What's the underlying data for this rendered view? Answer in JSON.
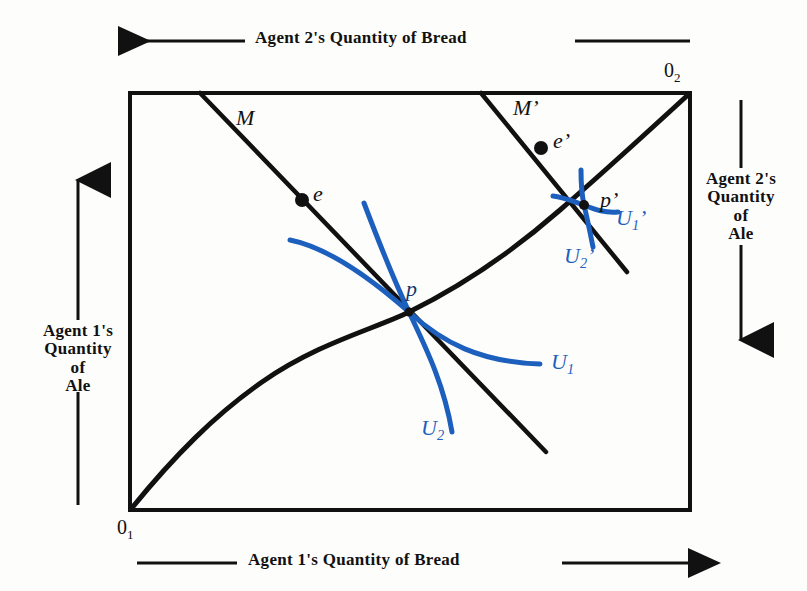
{
  "figure": {
    "type": "edgeworth-box",
    "title_top": "Agent 2's Quantity of Bread",
    "title_bottom": "Agent 1's Quantity of Bread",
    "title_left_lines": [
      "Agent 1's",
      "Quantity",
      "of",
      "Ale"
    ],
    "title_right_lines": [
      "Agent 2's",
      "Quantity",
      "of",
      "Ale"
    ],
    "origin_1": "0",
    "origin_1_sub": "1",
    "origin_2": "0",
    "origin_2_sub": "2",
    "colors": {
      "indifference_blue": "#1d5fbd",
      "line_black": "#111111",
      "background": "#fdfdfb"
    },
    "labels": {
      "budget_line_1": "M",
      "budget_line_2": "M’",
      "endowment_1": "e",
      "endowment_2": "e’",
      "equilibrium_1": "p",
      "equilibrium_2": "p’",
      "indiff_u1": "U",
      "indiff_u1_sub": "1",
      "indiff_u2": "U",
      "indiff_u2_sub": "2",
      "indiff_u1_prime": "U",
      "indiff_u1_prime_sub": "1",
      "indiff_u1_prime_mark": "’",
      "indiff_u2_prime": "U",
      "indiff_u2_prime_sub": "2",
      "indiff_u2_prime_mark": "’"
    },
    "points": {
      "e": {
        "x": 302,
        "y": 200
      },
      "e_prime": {
        "x": 541,
        "y": 148
      },
      "p": {
        "x": 409,
        "y": 312
      },
      "p_prime": {
        "x": 584,
        "y": 205
      }
    }
  }
}
